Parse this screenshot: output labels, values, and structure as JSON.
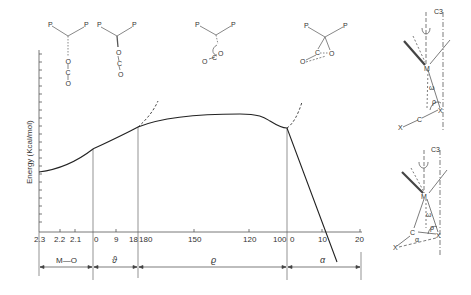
{
  "diagram": {
    "y_axis_label": "Energy (Kcal/mol)",
    "x_ticks": [
      {
        "label": "2.3",
        "x": 39
      },
      {
        "label": "2.2",
        "x": 60
      },
      {
        "label": "2.1",
        "x": 75
      },
      {
        "label": "0",
        "x": 96
      },
      {
        "label": "9",
        "x": 116
      },
      {
        "label": "18",
        "x": 131
      },
      {
        "label": "180",
        "x": 145
      },
      {
        "label": "150",
        "x": 194
      },
      {
        "label": "120",
        "x": 249
      },
      {
        "label": "100",
        "x": 281
      },
      {
        "label": "0",
        "x": 292
      },
      {
        "label": "10",
        "x": 322
      },
      {
        "label": "20",
        "x": 360
      }
    ],
    "sections": [
      {
        "label": "M—O",
        "name": "section-metal-oxygen"
      },
      {
        "label": "ϑ",
        "name": "section-theta"
      },
      {
        "label": "ϱ",
        "name": "section-rho"
      },
      {
        "label": "α",
        "name": "section-alpha"
      }
    ],
    "structures": {
      "s1": {
        "p_left": "P",
        "p_right": "P",
        "chain": [
          "O",
          "C",
          "O"
        ]
      },
      "s2": {
        "p_left": "P",
        "p_right": "P",
        "chain": [
          "O",
          "C",
          "O"
        ]
      },
      "s3": {
        "p_left": "P",
        "p_right": "P",
        "o1": "O",
        "c": "C",
        "o2": "O"
      },
      "s4": {
        "p_left": "P",
        "p_right": "P",
        "c": "C",
        "o1": "O",
        "o2": "O"
      }
    },
    "side_diagrams": {
      "top": {
        "axis": "C3",
        "metal": "M",
        "x1": "X",
        "c": "C",
        "x2": "X",
        "omega": "ω",
        "rho": "ρ"
      },
      "bottom": {
        "axis": "C3",
        "metal": "M",
        "x1": "X",
        "c": "C",
        "x2": "X",
        "omega": "ω",
        "rho": "ρ",
        "alpha": "α"
      }
    }
  }
}
